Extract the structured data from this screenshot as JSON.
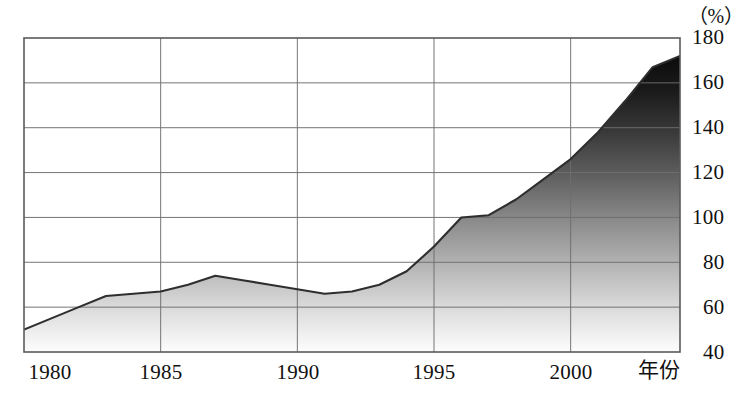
{
  "chart_data": {
    "type": "area",
    "title": "",
    "subtitle": "",
    "xlabel": "年份",
    "ylabel": "",
    "unit_label": "（%）",
    "xlim": [
      1980,
      2004
    ],
    "ylim": [
      40,
      180
    ],
    "grid": true,
    "legend": false,
    "legend_position": "none",
    "x_ticks": [
      "1980",
      "1985",
      "1990",
      "1995",
      "2000"
    ],
    "x_tick_values": [
      1980,
      1985,
      1990,
      1995,
      2000
    ],
    "y_ticks": [
      "40",
      "60",
      "80",
      "100",
      "120",
      "140",
      "160",
      "180"
    ],
    "y_tick_values": [
      40,
      60,
      80,
      100,
      120,
      140,
      160,
      180
    ],
    "fill_style": "vertical-gradient-dark-top-light-bottom",
    "fill_top_color": "#111111",
    "fill_bottom_color": "#fcfcfc",
    "line_color": "#333333",
    "grid_color": "#7a7a7a",
    "axis_color": "#555555",
    "x": [
      1980,
      1981,
      1982,
      1983,
      1984,
      1985,
      1986,
      1987,
      1988,
      1989,
      1990,
      1991,
      1992,
      1993,
      1994,
      1995,
      1996,
      1997,
      1998,
      1999,
      2000,
      2001,
      2002,
      2003,
      2004
    ],
    "values": [
      50,
      55,
      60,
      65,
      66,
      67,
      70,
      74,
      72,
      70,
      68,
      66,
      67,
      70,
      76,
      87,
      100,
      101,
      108,
      117,
      126,
      138,
      152,
      167,
      172
    ],
    "series": [
      {
        "name": "",
        "values": [
          50,
          55,
          60,
          65,
          66,
          67,
          70,
          74,
          72,
          70,
          68,
          66,
          67,
          70,
          76,
          87,
          100,
          101,
          108,
          117,
          126,
          138,
          152,
          167,
          172
        ]
      }
    ]
  },
  "axes": {
    "unit": "（%）",
    "x_axis_name": "年份"
  }
}
